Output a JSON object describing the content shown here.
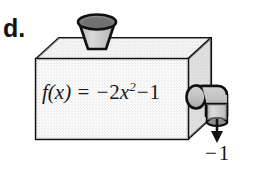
{
  "figure": {
    "part_label": "d.",
    "kind": "function-machine-diagram",
    "input_funnel": {
      "name": "input-funnel",
      "rim_color": "#7d7d7d",
      "body_color": "#c9c9c9"
    },
    "box": {
      "name": "function-machine-box",
      "front_face_color": "#ededed",
      "top_face_color": "#e3e3e3",
      "side_face_color": "#cdcdcd",
      "outline_color": "#101010"
    },
    "formula": {
      "f_of_x": "f(x)",
      "equals": "=",
      "minus_1": "−",
      "coefficient": "2",
      "variable": "x",
      "exponent": "2",
      "minus_2": "−",
      "constant": "1",
      "full_text": "f(x) = −2x²−1"
    },
    "output_pipe": {
      "name": "output-pipe",
      "body_color": "#c6c6c6",
      "nozzle_color": "#b9b9b9"
    },
    "output_arrow": {
      "name": "output-arrow",
      "direction": "down",
      "color": "#111111"
    },
    "output_value": {
      "minus": "−",
      "value": "1",
      "full_text": "−1"
    }
  }
}
